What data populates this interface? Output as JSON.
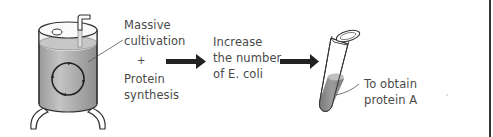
{
  "diagram": {
    "steps": [
      {
        "id": "fermenter",
        "icon": "fermenter-tank-icon",
        "label_lines": [
          "Massive",
          "cultivation"
        ],
        "connector": "+",
        "label2_lines": [
          "Protein",
          "synthesis"
        ]
      },
      {
        "id": "increase",
        "label_lines": [
          "Increase",
          "the number",
          "of E. coli"
        ]
      },
      {
        "id": "tube",
        "icon": "test-tube-icon",
        "label_lines": [
          "To obtain",
          "protein A"
        ]
      }
    ],
    "labels": {
      "massive_1": "Massive",
      "massive_2": "cultivation",
      "plus": "+",
      "protein_1": "Protein",
      "protein_2": "synthesis",
      "increase_1": "Increase",
      "increase_2": "the number",
      "increase_3": "of E. coli",
      "obtain_1": "To obtain",
      "obtain_2": "protein A"
    },
    "colors": {
      "liquid": "#a8a8a8",
      "liquid_top": "#c8c8c8",
      "outline": "#333333",
      "arrow": "#222222",
      "tube_liquid": "#8a8a8a",
      "text": "#4a4a4a"
    }
  }
}
